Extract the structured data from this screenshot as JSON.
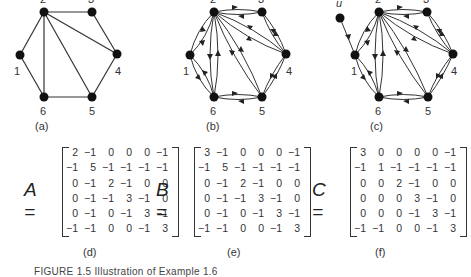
{
  "figure": {
    "caption": "FIGURE 1.5  Illustration of Example 1.6",
    "panels": [
      {
        "id": "a",
        "label": "(a)",
        "type": "undirected-graph",
        "nodes": [
          "1",
          "2",
          "3",
          "4",
          "5",
          "6"
        ],
        "edges": [
          [
            "1",
            "2"
          ],
          [
            "1",
            "6"
          ],
          [
            "2",
            "3"
          ],
          [
            "2",
            "4"
          ],
          [
            "2",
            "5"
          ],
          [
            "2",
            "6"
          ],
          [
            "3",
            "4"
          ],
          [
            "4",
            "5"
          ],
          [
            "5",
            "6"
          ]
        ]
      },
      {
        "id": "b",
        "label": "(b)",
        "type": "directed-graph",
        "nodes": [
          "1",
          "2",
          "3",
          "4",
          "5",
          "6"
        ],
        "edges": "each undirected edge of (a) replaced by two opposite arcs"
      },
      {
        "id": "c",
        "label": "(c)",
        "type": "directed-graph",
        "nodes": [
          "u",
          "1",
          "2",
          "3",
          "4",
          "5",
          "6"
        ],
        "extra_edge": [
          "u",
          "1"
        ]
      }
    ],
    "matrices": [
      {
        "name": "A",
        "label": "(d)",
        "rows": [
          [
            "2",
            "−1",
            "0",
            "0",
            "0",
            "−1"
          ],
          [
            "−1",
            "5",
            "−1",
            "−1",
            "−1",
            "−1"
          ],
          [
            "0",
            "−1",
            "2",
            "−1",
            "0",
            "0"
          ],
          [
            "0",
            "−1",
            "−1",
            "3",
            "−1",
            "0"
          ],
          [
            "0",
            "−1",
            "0",
            "−1",
            "3",
            "−1"
          ],
          [
            "−1",
            "−1",
            "0",
            "0",
            "−1",
            "3"
          ]
        ]
      },
      {
        "name": "B",
        "label": "(e)",
        "rows": [
          [
            "3",
            "−1",
            "0",
            "0",
            "0",
            "−1"
          ],
          [
            "−1",
            "5",
            "−1",
            "−1",
            "−1",
            "−1"
          ],
          [
            "0",
            "−1",
            "2",
            "−1",
            "0",
            "0"
          ],
          [
            "0",
            "−1",
            "−1",
            "3",
            "−1",
            "0"
          ],
          [
            "0",
            "−1",
            "0",
            "−1",
            "3",
            "−1"
          ],
          [
            "−1",
            "−1",
            "0",
            "0",
            "−1",
            "3"
          ]
        ]
      },
      {
        "name": "C",
        "label": "(f)",
        "rows": [
          [
            "3",
            "0",
            "0",
            "0",
            "0",
            "−1"
          ],
          [
            "−1",
            "1",
            "−1",
            "−1",
            "−1",
            "−1"
          ],
          [
            "0",
            "0",
            "2",
            "−1",
            "0",
            "0"
          ],
          [
            "0",
            "0",
            "0",
            "3",
            "−1",
            "0"
          ],
          [
            "0",
            "0",
            "0",
            "−1",
            "3",
            "−1"
          ],
          [
            "−1",
            "−1",
            "0",
            "0",
            "−1",
            "3"
          ]
        ]
      }
    ]
  }
}
